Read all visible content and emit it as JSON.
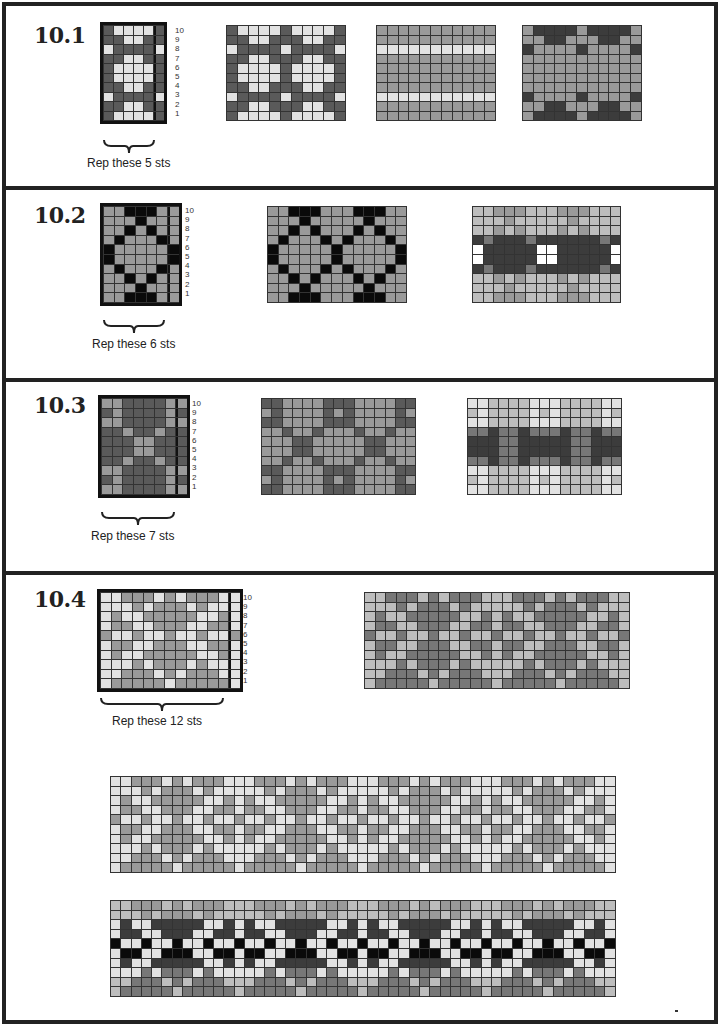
{
  "colors": {
    "D": "#5a5a5a",
    "L": "#e2e2e2",
    "M": "#9a9a9a",
    "B": "#0a0a0a",
    "W": "#ffffff",
    "K": "#3c3c3c",
    "G": "#bdbdbd",
    "N": "#777777"
  },
  "sections": [
    {
      "id": "10.1",
      "title": "10.1",
      "rep_label": "Rep these 5 sts",
      "row_numbers": [
        "10",
        "9",
        "8",
        "7",
        "6",
        "5",
        "4",
        "3",
        "2",
        "1"
      ],
      "chart": {
        "rows": [
          "DLLLLD",
          "DDLLDD",
          "LDDDDL",
          "DDLLDD",
          "DLLLLD",
          "DLLLLD",
          "DDLLDD",
          "LDDDDL",
          "DDLLDD",
          "DLLLLD"
        ]
      },
      "swatches": [
        {
          "rows": [
            "DLLLLDLLLLD",
            "DDLLDDDLLDD",
            "LDDDDLDDDDL",
            "DDLLDDDLLDD",
            "DLLLLDLLLLD",
            "DLLLLDLLLLD",
            "DDLLDDDLLDD",
            "LDDDDLDDDDL",
            "DDLLDDDLLDD",
            "DLLLLDLLLLD"
          ]
        },
        {
          "rows": [
            "MMMMMMMMMMM",
            "MMMMMMMMMMM",
            "LLLLLLLLLLL",
            "MMMMMMMMMMM",
            "MMMMMMMMMMM",
            "MMMMMMMMMMM",
            "MMMMMMMMMMM",
            "LLLLLLLLLLL",
            "MMMMMMMMMMM",
            "MMMMMMMMMMM"
          ]
        },
        {
          "rows": [
            "MKKKKMKKKKM",
            "MMKKMMMKKMM",
            "KMMMMKMMMMK",
            "MMMMMMMMMMM",
            "MMMMMMMMMMM",
            "MMMMMMMMMMM",
            "MMMMMMMMMMM",
            "KMMMMKMMMMK",
            "MMKKMMMKKMM",
            "MKKKKMKKKKM"
          ]
        }
      ]
    },
    {
      "id": "10.2",
      "title": "10.2",
      "rep_label": "Rep these 6 sts",
      "row_numbers": [
        "10",
        "9",
        "8",
        "7",
        "6",
        "5",
        "4",
        "3",
        "2",
        "1"
      ],
      "chart": {
        "rows": [
          "MMBBBMM",
          "MMMBMMM",
          "MMBMBMM",
          "MBMMMBM",
          "BMMMMMB",
          "BMMMMMB",
          "MBMMMBM",
          "MMBMBMM",
          "MMMBMMM",
          "MMBBBMM"
        ]
      },
      "swatches": [
        {
          "rows": [
            "MMBBBMMMBBBMM",
            "MMMBMMMMMBMMM",
            "MMBMBMMMBMBMM",
            "MBMMMBMBMMMBM",
            "BMMMMMBMMMMMB",
            "BMMMMMBMMMMMB",
            "MBMMMBMBMMMBM",
            "MMBMBMMMBMBMM",
            "MMMBMMMMMBMMM",
            "MMBBBMMMBBBMM"
          ]
        },
        {
          "rows": [
            "GGMMMGGGMMMGGG",
            "GGGMGGGGGMGGGG",
            "GGMGMGGGMGMGGG",
            "KNKKKNKKKKKKNK",
            "WKKKKKWWKKKKKW",
            "WKKKKKWWKKKKKW",
            "KNKKKNKKKKKKNK",
            "GGMGMGGGMGMGGG",
            "GGGMGGGGGMGGGG",
            "GGMMMGGGMMMGGG"
          ]
        }
      ]
    },
    {
      "id": "10.3",
      "title": "10.3",
      "rep_label": "Rep these 7 sts",
      "row_numbers": [
        "10",
        "9",
        "8",
        "7",
        "6",
        "5",
        "4",
        "3",
        "2",
        "1"
      ],
      "chart": {
        "rows": [
          "MMDDDDMM",
          "DMDDDDMD",
          "MMDDDDMM",
          "DDMDDMDD",
          "DDDMMDDD",
          "DDDMMDDD",
          "DDMDDMDD",
          "MMDDDDMM",
          "DMDDDDMD",
          "MMDDDDMM"
        ]
      },
      "swatches": [
        {
          "rows": [
            "DDMMMMDDDMMMMDD",
            "MDMMMMDMDMMMMDM",
            "DDMMMMDDDMMMMDD",
            "MMDMMDMMMDMMDMM",
            "MMMDDMMMMMDDMMM",
            "MMMDDMMMMMDDMMM",
            "MMDMMDMMMDMMDMM",
            "DDMMMMDDDMMMMDD",
            "MDMMMMDMDMMMMDM",
            "DDMMMMDDDMMMMDD"
          ]
        },
        {
          "rows": [
            "LLGGGGLLLGGGGLL",
            "GLGGGGLGLGGGGLG",
            "LLGGGGLLLGGGGLL",
            "NNKNNKNNNKNNKNN",
            "KKKNNKKKKKNNKKK",
            "KKKNNKKKKKNNKKK",
            "NNKNNKNNNKNNKNN",
            "LLGGGGLLLGGGGLL",
            "GLGGGGLGLGGGGLG",
            "LLGGGGLLLGGGGLL"
          ]
        }
      ]
    },
    {
      "id": "10.4",
      "title": "10.4",
      "rep_label": "Rep these 12 sts",
      "row_numbers": [
        "10",
        "9",
        "8",
        "7",
        "6",
        "5",
        "4",
        "3",
        "2",
        "1"
      ],
      "chart": {
        "rows": [
          "LLMMMLMLMMMLL",
          "LLLMLMMMLMLLL",
          "LMLLMMMMMLLML",
          "LMMLLMMMLLMML",
          "MLLMLLMLLMLLM",
          "LMMLLMMMLLMML",
          "LMLLMMMMMLLML",
          "LLLMLMMMLMLLL",
          "LLMMMLMLMMMLL",
          "LMMMMMLMMMMML"
        ]
      },
      "swatch_inverse": true,
      "wide_repeats": 4,
      "band_colors": {
        "light": [
          "M",
          "M",
          "K",
          "K",
          "B",
          "B",
          "K",
          "N",
          "N",
          "N"
        ],
        "dark": [
          "G",
          "G",
          "L",
          "L",
          "L",
          "L",
          "L",
          "L",
          "G",
          "G"
        ]
      }
    }
  ]
}
